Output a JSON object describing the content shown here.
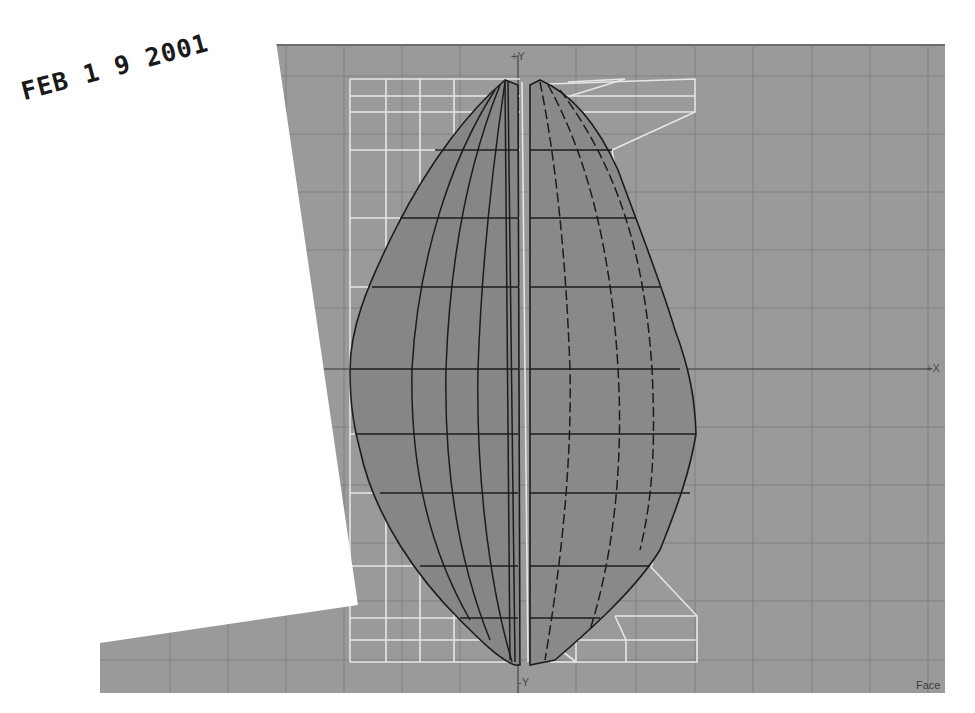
{
  "viewport": {
    "axis_labels": {
      "pos_y": "+Y",
      "neg_y": "-Y",
      "pos_x": "+X"
    },
    "view_mode_label": "Face",
    "colors": {
      "background": "#9a9a9a",
      "grid_line": "#7f7f7f",
      "mesh_fill": "#858585",
      "mesh_edge": "#1e1e1e",
      "lattice": "#e8e8e8",
      "paper": "#ffffff"
    }
  },
  "stamp": {
    "text": "FEB 1 9 2001"
  }
}
